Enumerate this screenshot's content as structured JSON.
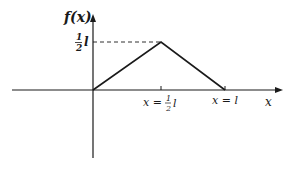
{
  "diagram": {
    "type": "piecewise-linear function plot",
    "y_axis_label": "f(x)",
    "x_axis_label": "x",
    "peak_value_label": {
      "num": "1",
      "den": "2",
      "var": "l"
    },
    "x_tick_mid_label": {
      "prefix": "x =",
      "num": "1",
      "den": "2",
      "var": "l"
    },
    "x_tick_end_label": "x = l",
    "points": [
      {
        "x": "0",
        "y": "0"
      },
      {
        "x": "l/2",
        "y": "l/2"
      },
      {
        "x": "l",
        "y": "0"
      }
    ],
    "colors": {
      "ink": "#1a1a1a",
      "background": "#ffffff"
    }
  }
}
